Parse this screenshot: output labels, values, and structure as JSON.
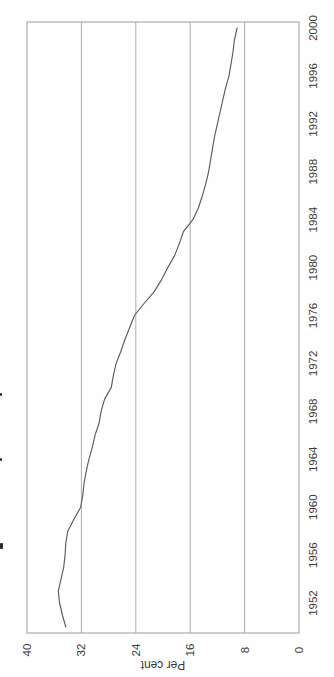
{
  "figure": {
    "background": "#fefefe",
    "border_color": "#9b9b9b",
    "grid_color": "#adadad",
    "line_color": "#5c5c5c",
    "text_color": "#3b3b3b"
  },
  "chart_data": {
    "type": "line",
    "title": "",
    "ylabel": "Per cent",
    "orientation": "rotated-90-ccw",
    "grid": "on",
    "legend": "none",
    "value_axis": {
      "min": 0,
      "max": 40,
      "tick_labels": [
        "40",
        "32",
        "24",
        "16",
        "8",
        "0"
      ],
      "tick_values": [
        40,
        32,
        24,
        16,
        8,
        0
      ],
      "gridline_values": [
        32,
        24,
        16,
        8
      ]
    },
    "time_axis": {
      "min": 1950,
      "max": 2000,
      "tick_labels": [
        "1952",
        "1956",
        "1960",
        "1964",
        "1968",
        "1972",
        "1976",
        "1980",
        "1984",
        "1988",
        "1992",
        "1996",
        "2000"
      ],
      "tick_years": [
        1952,
        1956,
        1960,
        1964,
        1968,
        1972,
        1976,
        1980,
        1984,
        1988,
        1992,
        1996,
        2000
      ]
    },
    "series": [
      {
        "name": "per-cent-line",
        "x": [
          1950,
          1951,
          1952,
          1953,
          1954,
          1955,
          1956,
          1957,
          1958,
          1959,
          1960,
          1961,
          1962,
          1963,
          1964,
          1965,
          1966,
          1967,
          1968,
          1969,
          1970,
          1971,
          1972,
          1973,
          1974,
          1975,
          1976,
          1977,
          1978,
          1979,
          1980,
          1981,
          1982,
          1983,
          1984,
          1985,
          1986,
          1987,
          1988,
          1989,
          1990,
          1991,
          1992,
          1993,
          1994,
          1995,
          1996,
          1997,
          1998,
          1999,
          2000
        ],
        "values": [
          34.3,
          34.8,
          35.2,
          35.4,
          35.0,
          34.6,
          34.4,
          34.3,
          34.0,
          33.1,
          32.1,
          31.8,
          31.6,
          31.3,
          30.9,
          30.4,
          30.0,
          29.4,
          29.1,
          28.6,
          27.6,
          27.3,
          26.9,
          26.2,
          25.6,
          24.9,
          24.2,
          22.8,
          21.3,
          20.2,
          19.3,
          18.3,
          17.6,
          17.0,
          15.6,
          14.8,
          14.2,
          13.7,
          13.3,
          13.0,
          12.7,
          12.4,
          12.0,
          11.6,
          11.2,
          10.8,
          10.3,
          10.0,
          9.7,
          9.5,
          9.1
        ]
      }
    ]
  },
  "artifacts": {
    "description": "clipped text fragments at left page edge",
    "count": 3
  }
}
